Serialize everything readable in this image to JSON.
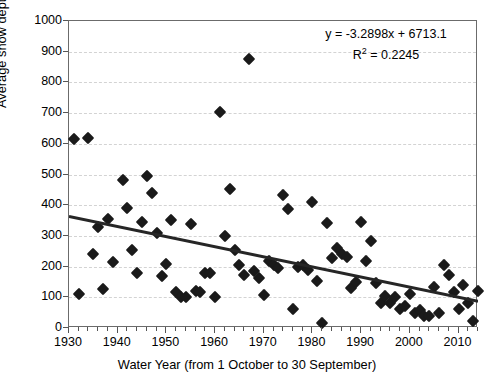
{
  "chart_data": {
    "type": "scatter",
    "title": "",
    "xlabel": "Water Year (from 1 October to 30 September)",
    "ylabel": "Average snow depth (mm)",
    "xlim": [
      1930,
      2014
    ],
    "ylim": [
      0,
      1000
    ],
    "x_tick_labels": [
      "1930",
      "1940",
      "1950",
      "1960",
      "1970",
      "1980",
      "1990",
      "2000",
      "2010"
    ],
    "x_tick_values": [
      1930,
      1940,
      1950,
      1960,
      1970,
      1980,
      1990,
      2000,
      2010
    ],
    "x_minor_tick_step": 2,
    "y_tick_labels": [
      "0",
      "100",
      "200",
      "300",
      "400",
      "500",
      "600",
      "700",
      "800",
      "900",
      "1000"
    ],
    "y_tick_values": [
      0,
      100,
      200,
      300,
      400,
      500,
      600,
      700,
      800,
      900,
      1000
    ],
    "grid": "horizontal dashed light gray",
    "legend": "none",
    "marker_style": "filled black diamond",
    "annotations": {
      "equation": "y = -3.2898x + 6713.1",
      "r_squared_label": "R",
      "r_squared_exponent": "2",
      "r_squared_value": " = 0.2245"
    },
    "trendline": {
      "type": "linear",
      "slope": -3.2898,
      "intercept": 6713.1,
      "r2": 0.2245,
      "x_start": 1930,
      "x_end": 2014,
      "y_start": 363,
      "y_end": 87,
      "color": "#262626"
    },
    "series": [
      {
        "name": "Average snow depth",
        "color": "#1a1a1a",
        "points": [
          [
            1931,
            615
          ],
          [
            1932,
            110
          ],
          [
            1934,
            618
          ],
          [
            1935,
            240
          ],
          [
            1936,
            330
          ],
          [
            1937,
            128
          ],
          [
            1938,
            355
          ],
          [
            1939,
            215
          ],
          [
            1941,
            482
          ],
          [
            1942,
            390
          ],
          [
            1943,
            255
          ],
          [
            1944,
            178
          ],
          [
            1945,
            345
          ],
          [
            1946,
            495
          ],
          [
            1947,
            440
          ],
          [
            1948,
            310
          ],
          [
            1949,
            170
          ],
          [
            1950,
            210
          ],
          [
            1951,
            352
          ],
          [
            1952,
            118
          ],
          [
            1953,
            100
          ],
          [
            1954,
            100
          ],
          [
            1955,
            338
          ],
          [
            1956,
            122
          ],
          [
            1957,
            118
          ],
          [
            1958,
            180
          ],
          [
            1959,
            178
          ],
          [
            1960,
            100
          ],
          [
            1961,
            705
          ],
          [
            1962,
            300
          ],
          [
            1963,
            452
          ],
          [
            1964,
            255
          ],
          [
            1965,
            205
          ],
          [
            1966,
            172
          ],
          [
            1967,
            875
          ],
          [
            1968,
            185
          ],
          [
            1969,
            162
          ],
          [
            1970,
            108
          ],
          [
            1971,
            218
          ],
          [
            1972,
            205
          ],
          [
            1973,
            195
          ],
          [
            1974,
            432
          ],
          [
            1975,
            388
          ],
          [
            1976,
            62
          ],
          [
            1977,
            200
          ],
          [
            1978,
            205
          ],
          [
            1979,
            188
          ],
          [
            1980,
            410
          ],
          [
            1981,
            152
          ],
          [
            1982,
            15
          ],
          [
            1983,
            342
          ],
          [
            1984,
            228
          ],
          [
            1985,
            260
          ],
          [
            1986,
            240
          ],
          [
            1987,
            232
          ],
          [
            1988,
            130
          ],
          [
            1989,
            150
          ],
          [
            1990,
            345
          ],
          [
            1991,
            218
          ],
          [
            1992,
            282
          ],
          [
            1993,
            145
          ],
          [
            1994,
            80
          ],
          [
            1995,
            105
          ],
          [
            1996,
            80
          ],
          [
            1997,
            100
          ],
          [
            1998,
            62
          ],
          [
            1999,
            72
          ],
          [
            2000,
            110
          ],
          [
            2001,
            48
          ],
          [
            2002,
            58
          ],
          [
            2003,
            40
          ],
          [
            2004,
            40
          ],
          [
            2005,
            132
          ],
          [
            2006,
            48
          ],
          [
            2007,
            205
          ],
          [
            2008,
            172
          ],
          [
            2009,
            118
          ],
          [
            2010,
            62
          ],
          [
            2011,
            140
          ],
          [
            2012,
            80
          ],
          [
            2013,
            22
          ],
          [
            2014,
            120
          ]
        ]
      }
    ]
  }
}
